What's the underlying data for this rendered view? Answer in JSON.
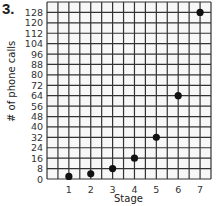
{
  "problem_number": "3.",
  "chart_data": {
    "type": "scatter",
    "title": "",
    "xlabel": "Stage",
    "ylabel": "# of phone calls",
    "x": [
      1,
      2,
      3,
      4,
      5,
      6,
      7
    ],
    "values": [
      2,
      4,
      8,
      16,
      32,
      64,
      128
    ],
    "x_ticks": [
      "1",
      "2",
      "3",
      "4",
      "5",
      "6",
      "7"
    ],
    "y_ticks": [
      "0",
      "8",
      "16",
      "24",
      "32",
      "40",
      "48",
      "56",
      "64",
      "72",
      "80",
      "88",
      "96",
      "104",
      "112",
      "120",
      "128"
    ],
    "xlim": [
      0,
      7.5
    ],
    "ylim": [
      0,
      136
    ],
    "grid": true,
    "legend": "none",
    "point_color": "#111111",
    "grid_color": "#333333"
  }
}
